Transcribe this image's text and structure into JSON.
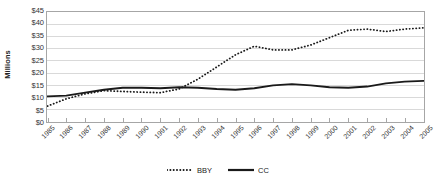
{
  "chart_data": {
    "type": "line",
    "title": "",
    "xlabel": "",
    "ylabel": "Millions",
    "x": [
      1985,
      1986,
      1987,
      1988,
      1989,
      1990,
      1991,
      1992,
      1993,
      1994,
      1995,
      1996,
      1997,
      1998,
      1999,
      2000,
      2001,
      2002,
      2003,
      2004,
      2005
    ],
    "categories": [
      "1985",
      "1986",
      "1987",
      "1988",
      "1989",
      "1990",
      "1991",
      "1992",
      "1993",
      "1994",
      "1995",
      "1996",
      "1997",
      "1998",
      "1999",
      "2000",
      "2001",
      "2002",
      "2003",
      "2004",
      "2005"
    ],
    "series": [
      {
        "name": "BBY",
        "style": "dotted",
        "color": "#1a1a1a",
        "values": [
          6.5,
          9.5,
          11.5,
          12.8,
          12.5,
          12.2,
          12.0,
          13.5,
          17.5,
          22.5,
          27.5,
          31.0,
          29.5,
          29.5,
          31.5,
          34.5,
          37.5,
          38.0,
          37.0,
          38.0,
          38.5
        ]
      },
      {
        "name": "CC",
        "style": "solid",
        "color": "#1a1a1a",
        "values": [
          10.5,
          10.8,
          12.0,
          13.2,
          14.0,
          14.0,
          13.8,
          14.2,
          14.0,
          13.5,
          13.2,
          13.8,
          15.0,
          15.5,
          15.0,
          14.2,
          14.0,
          14.5,
          15.8,
          16.5,
          16.8
        ]
      }
    ],
    "ylim": [
      0,
      45
    ],
    "y_ticks": [
      0,
      5,
      10,
      15,
      20,
      25,
      30,
      35,
      40,
      45
    ],
    "y_tick_labels": [
      "$0",
      "$5",
      "$10",
      "$15",
      "$20",
      "$25",
      "$30",
      "$35",
      "$40",
      "$45"
    ],
    "grid": true,
    "grid_color": "#d9d9d9",
    "axis_color": "#a6a6a6",
    "legend_position": "bottom",
    "legend": [
      {
        "label": "BBY",
        "style": "dotted"
      },
      {
        "label": "CC",
        "style": "solid"
      }
    ]
  }
}
